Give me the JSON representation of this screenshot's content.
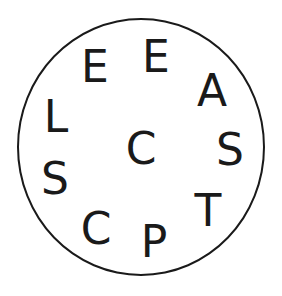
{
  "puzzle": {
    "type": "letter-wheel",
    "ring_color": "#1a1a1a",
    "center_letter": {
      "char": "C",
      "x": 141,
      "y": 149
    },
    "outer_letters": [
      {
        "char": "E",
        "x": 95,
        "y": 67
      },
      {
        "char": "E",
        "x": 156,
        "y": 57
      },
      {
        "char": "A",
        "x": 212,
        "y": 91
      },
      {
        "char": "L",
        "x": 56,
        "y": 117
      },
      {
        "char": "S",
        "x": 230,
        "y": 150
      },
      {
        "char": "S",
        "x": 55,
        "y": 179
      },
      {
        "char": "T",
        "x": 208,
        "y": 211
      },
      {
        "char": "C",
        "x": 96,
        "y": 229
      },
      {
        "char": "P",
        "x": 154,
        "y": 242
      }
    ]
  }
}
